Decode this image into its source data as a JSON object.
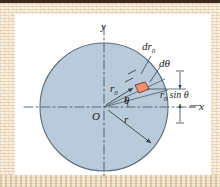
{
  "figure": {
    "panel_background": "#ffffff",
    "border_color": "#f2e4cf",
    "top_strip_color": "#3a2a1c",
    "disk": {
      "fill": "#b9cada",
      "stroke": "#5c6c7c",
      "center_label": "O",
      "center_x": 104,
      "center_y": 107,
      "radius": 64
    },
    "element": {
      "fill": "#f09070",
      "stroke": "#7a3520"
    },
    "axes": {
      "x_label": "x",
      "y_label": "y",
      "axis_style": "dash-dot",
      "axis_color": "#5b6b7b"
    },
    "labels": {
      "origin": "O",
      "y_axis": "y",
      "x_axis": "x",
      "radial_thickness": "dr",
      "radial_thickness_sub": "0",
      "radial_distance": "r",
      "radial_distance_sub": "0",
      "angle_increment": "dθ",
      "angle": "θ",
      "disk_radius": "r",
      "height_expr_lead": "r",
      "height_expr_sub": "0",
      "height_expr_tail": " sin θ",
      "height_full": "r₀ sin θ",
      "dash_x": "—"
    }
  }
}
